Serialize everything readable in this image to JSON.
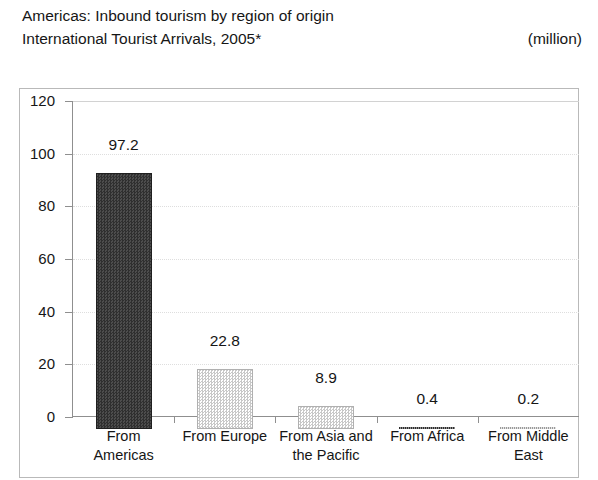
{
  "header": {
    "title": "Americas: Inbound tourism by region of origin",
    "subtitle": "International Tourist Arrivals, 2005*",
    "unit": "(million)"
  },
  "chart_data": {
    "type": "bar",
    "title": "Americas: Inbound tourism by region of origin",
    "subtitle": "International Tourist Arrivals, 2005*",
    "xlabel": "",
    "ylabel": "",
    "unit": "million",
    "categories": [
      "From Americas",
      "From Europe",
      "From Asia and the Pacific",
      "From Africa",
      "From Middle East"
    ],
    "category_lines": [
      [
        "From",
        "Americas"
      ],
      [
        "From Europe",
        ""
      ],
      [
        "From Asia and",
        "the Pacific"
      ],
      [
        "From Africa",
        ""
      ],
      [
        "From Middle",
        "East"
      ]
    ],
    "values": [
      97.2,
      22.8,
      8.9,
      0.4,
      0.2
    ],
    "value_labels": [
      "97.2",
      "22.8",
      "8.9",
      "0.4",
      "0.2"
    ],
    "ylim": [
      0,
      120
    ],
    "ytick_values": [
      0,
      20,
      40,
      60,
      80,
      100,
      120
    ],
    "ytick_labels": [
      "0",
      "20",
      "40",
      "60",
      "80",
      "100",
      "120"
    ],
    "grid": true,
    "legend": false,
    "bar_fills": [
      "dark-dither",
      "light-dither",
      "light-dither",
      "dark-sliver",
      "light-sliver"
    ],
    "colors": {
      "bar_dark": "#3d3d3d",
      "bar_light": "#d8d8d8",
      "axis": "#8f8f8f",
      "grid": "#dedede",
      "frame": "#b9b9b9",
      "text": "#161616"
    }
  }
}
